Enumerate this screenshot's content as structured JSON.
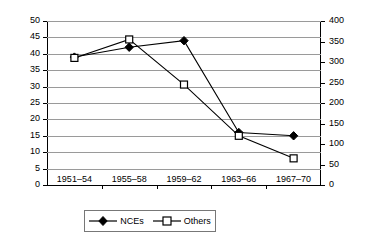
{
  "chart_data": {
    "type": "line",
    "title": "",
    "xlabel": "",
    "ylabel": "",
    "categories": [
      "1951–54",
      "1955–58",
      "1959–62",
      "1963–66",
      "1967–70"
    ],
    "grid": true,
    "legend_position": "bottom",
    "axes": {
      "left": {
        "label": "",
        "ylim": [
          0,
          50
        ],
        "tick_step": 5,
        "ticks": [
          "0",
          "5",
          "10",
          "15",
          "20",
          "25",
          "30",
          "35",
          "40",
          "45",
          "50"
        ]
      },
      "right": {
        "label": "",
        "ylim": [
          0,
          400
        ],
        "tick_step": 50,
        "ticks": [
          "0",
          "50",
          "100",
          "150",
          "200",
          "250",
          "300",
          "350",
          "400"
        ]
      }
    },
    "series": [
      {
        "name": "NCEs",
        "axis": "left",
        "marker": "filled-diamond",
        "color": "#000000",
        "values": [
          39,
          42,
          44,
          16,
          15
        ]
      },
      {
        "name": "Others",
        "axis": "right",
        "marker": "open-square",
        "color": "#000000",
        "values": [
          310,
          355,
          245,
          120,
          65
        ]
      }
    ]
  },
  "legend": {
    "entries": [
      {
        "label": "NCEs",
        "marker": "filled-diamond"
      },
      {
        "label": "Others",
        "marker": "open-square"
      }
    ]
  }
}
